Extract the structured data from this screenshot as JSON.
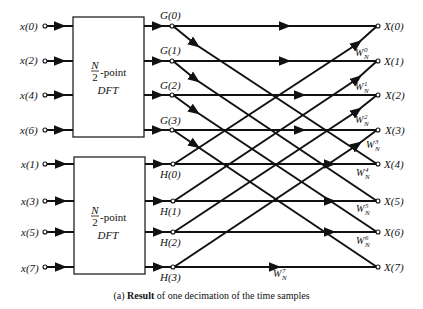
{
  "diagram": {
    "type": "signal-flow-graph",
    "inputs_top": [
      "x(0)",
      "x(2)",
      "x(4)",
      "x(6)"
    ],
    "inputs_bottom": [
      "x(1)",
      "x(3)",
      "x(5)",
      "x(7)"
    ],
    "block_top": {
      "fraction_num": "N",
      "fraction_den": "2",
      "suffix": "-point",
      "label2": "DFT"
    },
    "block_bottom": {
      "fraction_num": "N",
      "fraction_den": "2",
      "suffix": "-point",
      "label2": "DFT"
    },
    "g_outputs": [
      "G(0)",
      "G(1)",
      "G(2)",
      "G(3)"
    ],
    "h_outputs": [
      "H(0)",
      "H(1)",
      "H(2)",
      "H(3)"
    ],
    "outputs": [
      "X(0)",
      "X(1)",
      "X(2)",
      "X(3)",
      "X(4)",
      "X(5)",
      "X(6)",
      "X(7)"
    ],
    "twiddles": [
      {
        "base": "W",
        "sub": "N",
        "sup": "0"
      },
      {
        "base": "W",
        "sub": "N",
        "sup": "1"
      },
      {
        "base": "W",
        "sub": "N",
        "sup": "2"
      },
      {
        "base": "W",
        "sub": "N",
        "sup": "3"
      },
      {
        "base": "W",
        "sub": "N",
        "sup": "4"
      },
      {
        "base": "W",
        "sub": "N",
        "sup": "5"
      },
      {
        "base": "W",
        "sub": "N",
        "sup": "6"
      },
      {
        "base": "W",
        "sub": "N",
        "sup": "7"
      }
    ],
    "caption": {
      "tag": "(a)",
      "bold": "Result",
      "text": " of one decimation of the time samples"
    }
  }
}
